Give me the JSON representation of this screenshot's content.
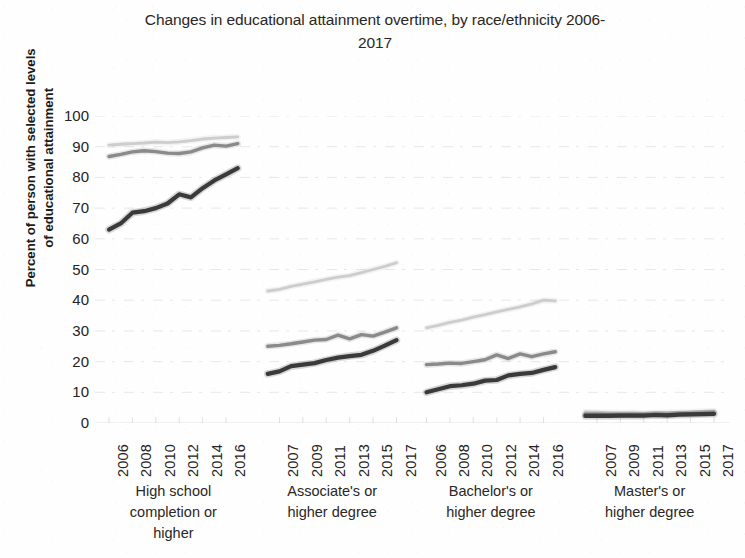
{
  "chart_data": {
    "type": "line",
    "title_line1": "Changes in educational attainment overtime, by race/ethnicity 2006-",
    "title_line2": "2017",
    "xlabel": "",
    "ylabel": "Percent of person with selected levels of educational attainment",
    "ylabel_line1": "Percent of person with selected levels",
    "ylabel_line2": "of educational attainment",
    "ylim": [
      0,
      100
    ],
    "ytick_labels": [
      "100",
      "90",
      "80",
      "70",
      "60",
      "50",
      "40",
      "30",
      "20",
      "10",
      "0"
    ],
    "ytick_values": [
      100,
      90,
      80,
      70,
      60,
      50,
      40,
      30,
      20,
      10,
      0
    ],
    "grid": true,
    "legend": "none",
    "panel_layout": "4 side-by-side year-blocks on one shared y-axis",
    "x": [
      2006,
      2007,
      2008,
      2009,
      2010,
      2011,
      2012,
      2013,
      2014,
      2015,
      2016,
      2017
    ],
    "series_colors": [
      "#c9c9c9",
      "#8a8a8a",
      "#3a3a3a"
    ],
    "groups": [
      {
        "name": "High school completion or higher",
        "caption_lines": [
          "High school",
          "completion or",
          "higher"
        ],
        "xtick_labels": [
          "2006",
          "2008",
          "2010",
          "2012",
          "2014",
          "2016"
        ],
        "xtick_years": [
          2006,
          2008,
          2010,
          2012,
          2014,
          2016
        ],
        "series": [
          {
            "name": "light-gray",
            "color": "#c9c9c9",
            "values": [
              90.5,
              90.8,
              91.0,
              91.2,
              91.5,
              91.3,
              91.6,
              92.0,
              92.5,
              92.8,
              93.0,
              93.2
            ]
          },
          {
            "name": "medium-gray",
            "color": "#8a8a8a",
            "values": [
              86.8,
              87.5,
              88.3,
              88.7,
              88.4,
              87.9,
              87.8,
              88.3,
              89.6,
              90.5,
              90.2,
              91.0
            ]
          },
          {
            "name": "dark",
            "color": "#3a3a3a",
            "values": [
              63.0,
              65.0,
              68.5,
              69.0,
              70.0,
              71.5,
              74.5,
              73.5,
              76.5,
              79.0,
              81.0,
              83.0
            ]
          }
        ]
      },
      {
        "name": "Associate's or higher degree",
        "caption_lines": [
          "Associate's or",
          "higher degree"
        ],
        "xtick_labels": [
          "2007",
          "2009",
          "2011",
          "2013",
          "2015",
          "2017"
        ],
        "xtick_years": [
          2007,
          2009,
          2011,
          2013,
          2015,
          2017
        ],
        "series": [
          {
            "name": "light-gray",
            "color": "#c9c9c9",
            "values": [
              43.0,
              43.5,
              44.5,
              45.2,
              46.0,
              46.8,
              47.5,
              48.0,
              49.0,
              50.0,
              51.0,
              52.2
            ]
          },
          {
            "name": "medium-gray",
            "color": "#8a8a8a",
            "values": [
              25.0,
              25.3,
              25.8,
              26.4,
              27.0,
              27.2,
              28.6,
              27.4,
              28.8,
              28.3,
              29.6,
              31.0
            ]
          },
          {
            "name": "dark",
            "color": "#3a3a3a",
            "values": [
              16.0,
              16.8,
              18.5,
              19.0,
              19.5,
              20.5,
              21.3,
              21.8,
              22.2,
              23.5,
              25.2,
              27.0
            ]
          }
        ]
      },
      {
        "name": "Bachelor's or higher degree",
        "caption_lines": [
          "Bachelor's or",
          "higher degree"
        ],
        "xtick_labels": [
          "2006",
          "2008",
          "2010",
          "2012",
          "2014",
          "2016"
        ],
        "xtick_years": [
          2006,
          2008,
          2010,
          2012,
          2014,
          2016
        ],
        "series": [
          {
            "name": "light-gray",
            "color": "#c9c9c9",
            "values": [
              31.0,
              31.8,
              32.8,
              33.5,
              34.5,
              35.3,
              36.2,
              37.0,
              37.8,
              38.8,
              40.0,
              39.8
            ]
          },
          {
            "name": "medium-gray",
            "color": "#8a8a8a",
            "values": [
              19.0,
              19.2,
              19.5,
              19.4,
              20.0,
              20.6,
              22.2,
              21.0,
              22.5,
              21.6,
              22.5,
              23.2
            ]
          },
          {
            "name": "dark",
            "color": "#3a3a3a",
            "values": [
              10.0,
              11.0,
              12.0,
              12.3,
              12.8,
              13.8,
              14.0,
              15.5,
              16.0,
              16.3,
              17.3,
              18.2
            ]
          }
        ]
      },
      {
        "name": "Master's or higher degree",
        "caption_lines": [
          "Master's or",
          "higher degree"
        ],
        "xtick_labels": [
          "2007",
          "2009",
          "2011",
          "2013",
          "2015",
          "2017"
        ],
        "xtick_years": [
          2007,
          2009,
          2011,
          2013,
          2015,
          2017
        ],
        "series": [
          {
            "name": "light-gray",
            "color": "#c9c9c9",
            "values": [
              3.6,
              3.5,
              3.4,
              3.3,
              3.4,
              3.2,
              3.3,
              3.4,
              3.5,
              3.6,
              3.8,
              4.0
            ]
          },
          {
            "name": "medium-gray",
            "color": "#8a8a8a",
            "values": [
              2.8,
              2.8,
              2.7,
              2.7,
              2.7,
              2.6,
              2.9,
              2.7,
              2.9,
              3.0,
              3.1,
              3.2
            ]
          },
          {
            "name": "dark",
            "color": "#3a3a3a",
            "values": [
              2.3,
              2.3,
              2.3,
              2.4,
              2.4,
              2.4,
              2.6,
              2.5,
              2.7,
              2.8,
              2.9,
              3.0
            ]
          }
        ]
      }
    ]
  }
}
